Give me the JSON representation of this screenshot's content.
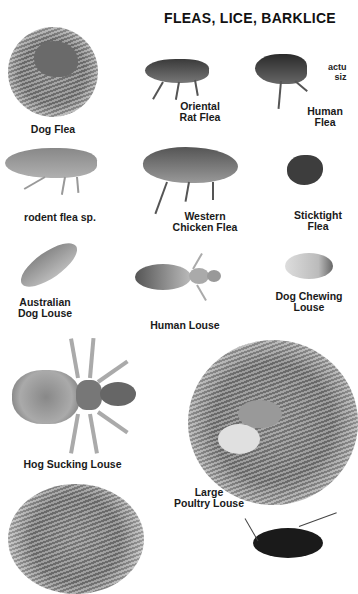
{
  "page": {
    "title": "FLEAS, LICE, BARKLICE",
    "note": [
      "actu",
      "siz"
    ]
  },
  "specimens": [
    {
      "name": "dog-flea",
      "label": [
        "Dog Flea"
      ]
    },
    {
      "name": "oriental-rat-flea",
      "label": [
        "Oriental",
        "Rat Flea"
      ]
    },
    {
      "name": "human-flea",
      "label": [
        "Human",
        "Flea"
      ]
    },
    {
      "name": "rodent-flea",
      "label": [
        "rodent flea sp."
      ]
    },
    {
      "name": "western-chicken-flea",
      "label": [
        "Western",
        "Chicken Flea"
      ]
    },
    {
      "name": "sticktight-flea",
      "label": [
        "Sticktight",
        "Flea"
      ]
    },
    {
      "name": "australian-dog-louse",
      "label": [
        "Australian",
        "Dog Louse"
      ]
    },
    {
      "name": "human-louse",
      "label": [
        "Human Louse"
      ]
    },
    {
      "name": "dog-chewing-louse",
      "label": [
        "Dog Chewing",
        "Louse"
      ]
    },
    {
      "name": "hog-sucking-louse",
      "label": [
        "Hog Sucking Louse"
      ]
    },
    {
      "name": "large-poultry-louse",
      "label": [
        "Large",
        "Poultry Louse"
      ]
    }
  ]
}
